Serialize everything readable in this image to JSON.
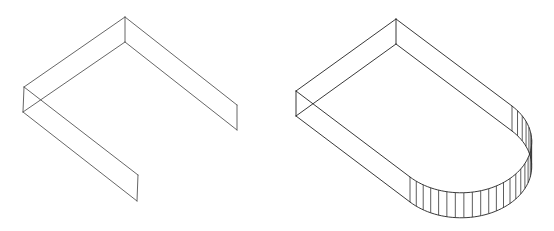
{
  "figures": [
    {
      "name": "open-u-channel",
      "description": "Isometric wireframe of an open U-shaped wall (three straight wall segments)"
    },
    {
      "name": "closed-rounded-wall",
      "description": "Isometric wireframe of a U-shaped wall closed by a semicircular end with vertical hatching"
    }
  ],
  "style": {
    "stroke_left": "#555555",
    "stroke_right": "#222222",
    "background": "#ffffff"
  }
}
